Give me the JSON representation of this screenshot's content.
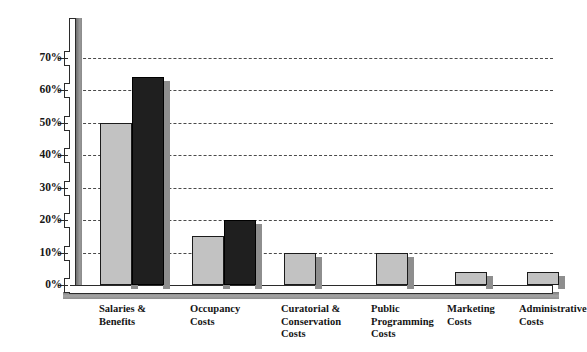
{
  "chart_data": {
    "type": "bar",
    "title": "",
    "subtitle": "",
    "xlabel": "",
    "ylabel": "",
    "ylim": [
      0,
      70
    ],
    "y_tick_labels": [
      "70%",
      "60%",
      "50%",
      "40%",
      "30%",
      "20%",
      "10%",
      "0%"
    ],
    "y_tick_values": [
      70,
      60,
      50,
      40,
      30,
      20,
      10,
      0
    ],
    "grid": true,
    "grid_style": "dashed horizontal",
    "legend": "none",
    "categories": [
      "Salaries &\nBenefits",
      "Occupancy\nCosts",
      "Curatorial &\nConservation\nCosts",
      "Public\nProgramming\nCosts",
      "Marketing\nCosts",
      "Administrative\nCosts"
    ],
    "series": [
      {
        "name": "Series 1",
        "color": "#c2c2c2",
        "values": [
          50,
          15,
          10,
          10,
          4,
          4
        ]
      },
      {
        "name": "Series 2",
        "color": "#1f1f1f",
        "values": [
          64,
          20,
          null,
          null,
          null,
          null
        ]
      }
    ]
  },
  "axis": {
    "wall_color": "#8c8c8c",
    "line_color": "#2b2b2b",
    "grid_color": "#4a4a4a"
  },
  "colors": {
    "light_bar": "#c2c2c2",
    "dark_bar": "#1f1f1f",
    "shadow": "#8e8e8e",
    "background": "#ffffff",
    "text": "#151515"
  }
}
